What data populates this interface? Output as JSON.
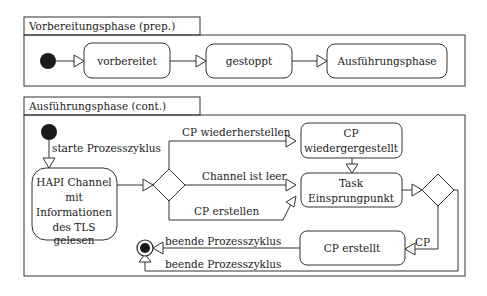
{
  "diagram": {
    "type": "uml-activity-diagram",
    "partitions": [
      {
        "id": "prep",
        "title": "Vorbereitungsphase (prep.)",
        "nodes": [
          {
            "id": "start1",
            "kind": "initial"
          },
          {
            "id": "vorbereitet",
            "kind": "state",
            "label": "vorbereitet"
          },
          {
            "id": "gestoppt",
            "kind": "state",
            "label": "gestoppt"
          },
          {
            "id": "ausfuehrung",
            "kind": "state",
            "label": "Ausführungsphase"
          }
        ],
        "edges": [
          {
            "from": "start1",
            "to": "vorbereitet",
            "label": ""
          },
          {
            "from": "vorbereitet",
            "to": "gestoppt",
            "label": ""
          },
          {
            "from": "gestoppt",
            "to": "ausfuehrung",
            "label": ""
          }
        ]
      },
      {
        "id": "cont",
        "title": "Ausführungsphase (cont.)",
        "nodes": [
          {
            "id": "start2",
            "kind": "initial"
          },
          {
            "id": "hapi",
            "kind": "state",
            "label_lines": [
              "HAPI Channel",
              "mit",
              "Informationen",
              "des TLS",
              "gelesen"
            ]
          },
          {
            "id": "decision1",
            "kind": "decision"
          },
          {
            "id": "cp_restored",
            "kind": "state",
            "label_lines": [
              "CP",
              "wiedergergestellt"
            ]
          },
          {
            "id": "task_entry",
            "kind": "state",
            "label_lines": [
              "Task",
              "Einsprungpunkt"
            ]
          },
          {
            "id": "decision2",
            "kind": "decision"
          },
          {
            "id": "cp_created",
            "kind": "state",
            "label": "CP erstellt"
          },
          {
            "id": "final",
            "kind": "final"
          }
        ],
        "edges": [
          {
            "from": "start2",
            "to": "hapi",
            "label": "starte Prozesszyklus"
          },
          {
            "from": "hapi",
            "to": "decision1",
            "label": ""
          },
          {
            "from": "decision1",
            "to": "cp_restored",
            "label": "CP wiederherstellen"
          },
          {
            "from": "decision1",
            "to": "task_entry",
            "label": "Channel ist leer"
          },
          {
            "from": "decision1",
            "to": "task_entry",
            "label": "CP erstellen"
          },
          {
            "from": "cp_restored",
            "to": "task_entry",
            "label": ""
          },
          {
            "from": "task_entry",
            "to": "decision2",
            "label": ""
          },
          {
            "from": "decision2",
            "to": "cp_created",
            "label": "CP"
          },
          {
            "from": "cp_created",
            "to": "final",
            "label": "beende Prozesszyklus"
          },
          {
            "from": "decision2",
            "to": "final",
            "label": "beende Prozesszyklus"
          }
        ]
      }
    ]
  },
  "labels": {
    "prep_title": "Vorbereitungsphase (prep.)",
    "vorbereitet": "vorbereitet",
    "gestoppt": "gestoppt",
    "ausfuehrung": "Ausführungsphase",
    "cont_title": "Ausführungsphase (cont.)",
    "starte": "starte Prozesszyklus",
    "hapi_1": "HAPI Channel",
    "hapi_2": "mit",
    "hapi_3": "Informationen",
    "hapi_4": "des TLS",
    "hapi_5": "gelesen",
    "cp_wiederherstellen": "CP wiederherstellen",
    "channel_leer": "Channel ist leer",
    "cp_erstellen": "CP erstellen",
    "cp_restored_1": "CP",
    "cp_restored_2": "wiedergergestellt",
    "task_1": "Task",
    "task_2": "Einsprungpunkt",
    "cp_created": "CP erstellt",
    "cp_edge": "CP",
    "beende_1": "beende Prozesszyklus",
    "beende_2": "beende Prozesszyklus"
  }
}
